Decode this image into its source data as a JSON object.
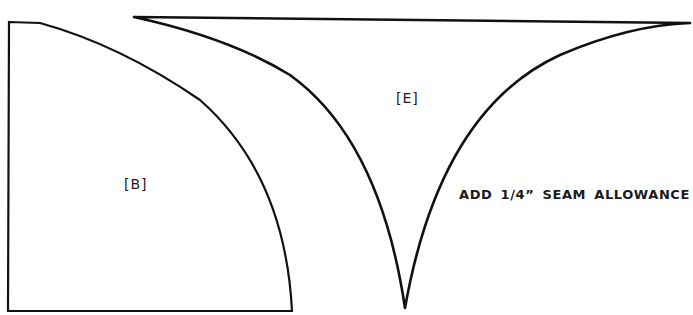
{
  "diagram": {
    "pieces": [
      {
        "id": "B",
        "label": "[B]",
        "shape": "quarter-circle"
      },
      {
        "id": "E",
        "label": "[E]",
        "shape": "curved-triangle"
      }
    ],
    "note": "ADD 1/4” SEAM ALLOWANCE",
    "colors": {
      "line": "#111111",
      "background": "#ffffff"
    }
  }
}
